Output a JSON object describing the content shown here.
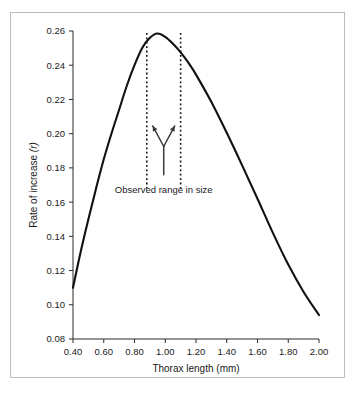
{
  "figure": {
    "border_color": "#b9bdc2",
    "background": "#ffffff"
  },
  "chart_data": {
    "type": "line",
    "title": "",
    "xlabel": "Thorax length (mm)",
    "ylabel": "Rate of increase (r)",
    "ylabel_plain": "Rate of increase",
    "ylabel_symbol": "(r)",
    "xlim": [
      0.4,
      2.0
    ],
    "ylim": [
      0.08,
      0.26
    ],
    "grid": false,
    "legend": "none",
    "xticks": [
      "0.40",
      "0.60",
      "0.80",
      "1.00",
      "1.20",
      "1.40",
      "1.60",
      "1.80",
      "2.00"
    ],
    "xtick_values": [
      0.4,
      0.6,
      0.8,
      1.0,
      1.2,
      1.4,
      1.6,
      1.8,
      2.0
    ],
    "yticks": [
      "0.08",
      "0.10",
      "0.12",
      "0.14",
      "0.16",
      "0.18",
      "0.20",
      "0.22",
      "0.24",
      "0.26"
    ],
    "ytick_values": [
      0.08,
      0.1,
      0.12,
      0.14,
      0.16,
      0.18,
      0.2,
      0.22,
      0.24,
      0.26
    ],
    "series": [
      {
        "name": "Rate of increase",
        "x": [
          0.4,
          0.45,
          0.5,
          0.55,
          0.6,
          0.65,
          0.7,
          0.75,
          0.8,
          0.85,
          0.9,
          0.95,
          1.0,
          1.05,
          1.1,
          1.15,
          1.2,
          1.3,
          1.4,
          1.5,
          1.6,
          1.7,
          1.8,
          1.9,
          2.0
        ],
        "y": [
          0.11,
          0.131,
          0.15,
          0.168,
          0.185,
          0.2,
          0.214,
          0.228,
          0.24,
          0.25,
          0.256,
          0.2585,
          0.2565,
          0.2525,
          0.2475,
          0.2415,
          0.2345,
          0.2185,
          0.2005,
          0.1815,
          0.162,
          0.142,
          0.1235,
          0.1075,
          0.094
        ]
      }
    ],
    "peak": {
      "x": 0.95,
      "y": 0.2585
    },
    "annotations": [
      {
        "name": "observed-range",
        "label": "Observed range in size",
        "type": "vertical-range-markers",
        "x_lines": [
          0.88,
          1.1
        ],
        "style": "dotted",
        "pointer": "y-shaped-double-arrow"
      }
    ]
  }
}
